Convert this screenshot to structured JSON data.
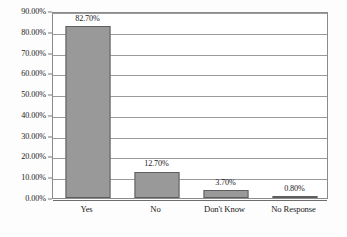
{
  "chart_data": {
    "type": "bar",
    "title": "",
    "xlabel": "",
    "ylabel": "",
    "categories": [
      "Yes",
      "No",
      "Don't Know",
      "No Response"
    ],
    "values": [
      82.7,
      12.7,
      3.7,
      0.8
    ],
    "value_labels": [
      "82.70%",
      "12.70%",
      "3.70%",
      "0.80%"
    ],
    "ylim": [
      0,
      90
    ],
    "ytick_values": [
      0,
      10,
      20,
      30,
      40,
      50,
      60,
      70,
      80,
      90
    ],
    "ytick_labels": [
      "0.00%",
      "10.00%",
      "20.00%",
      "30.00%",
      "40.00%",
      "50.00%",
      "60.00%",
      "70.00%",
      "80.00%",
      "90.00%"
    ],
    "grid": true,
    "legend": false,
    "legend_position": "none",
    "series": [
      {
        "name": "",
        "values": [
          82.7,
          12.7,
          3.7,
          0.8
        ]
      }
    ],
    "colors": {
      "bar_fill": "#999999",
      "bar_border": "#5e5e5e",
      "gridline": "#9a9a9a",
      "frame": "#8b8b8b",
      "plot_background": "#ffffff",
      "text": "#1b1b1b"
    }
  }
}
